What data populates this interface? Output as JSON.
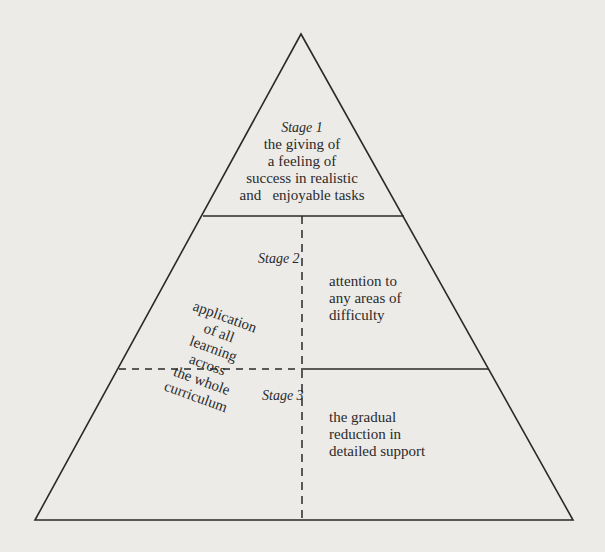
{
  "diagram": {
    "type": "pyramid",
    "stages": [
      {
        "title": "Stage 1",
        "description_lines": [
          "the giving of",
          "a feeling of",
          "success in realistic",
          "and   enjoyable tasks"
        ]
      },
      {
        "title": "Stage 2",
        "description_lines": [
          "attention to",
          "any areas of",
          "difficulty"
        ]
      },
      {
        "title": "Stage 3",
        "description_lines": [
          "the gradual",
          "reduction in",
          "detailed support"
        ]
      }
    ],
    "side_note_lines": [
      "application",
      "of all",
      "learning",
      "across",
      "the whole",
      "curriculum"
    ],
    "colors": {
      "background": "#ecebe8",
      "stroke": "#2a2a2a"
    }
  }
}
